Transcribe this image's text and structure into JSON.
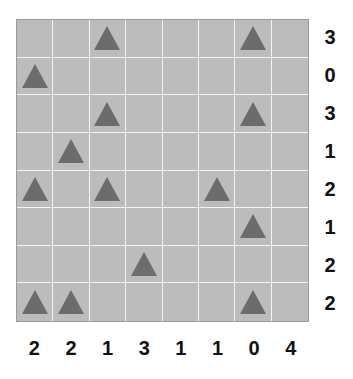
{
  "puzzle": {
    "rows": 8,
    "cols": 8,
    "colors": {
      "cell_background": "#bcbcbc",
      "grid_line": "#f4f4f4",
      "border": "#9a9a9a",
      "tree": "#6c6c6c",
      "clue_text": "#111111"
    },
    "icon": "triangle-tree-icon",
    "grid": [
      [
        0,
        0,
        1,
        0,
        0,
        0,
        1,
        0
      ],
      [
        1,
        0,
        0,
        0,
        0,
        0,
        0,
        0
      ],
      [
        0,
        0,
        1,
        0,
        0,
        0,
        1,
        0
      ],
      [
        0,
        1,
        0,
        0,
        0,
        0,
        0,
        0
      ],
      [
        1,
        0,
        1,
        0,
        0,
        1,
        0,
        0
      ],
      [
        0,
        0,
        0,
        0,
        0,
        0,
        1,
        0
      ],
      [
        0,
        0,
        0,
        1,
        0,
        0,
        0,
        0
      ],
      [
        1,
        1,
        0,
        0,
        0,
        0,
        1,
        0
      ]
    ],
    "row_clues": [
      "3",
      "0",
      "3",
      "1",
      "2",
      "1",
      "2",
      "2"
    ],
    "col_clues": [
      "2",
      "2",
      "1",
      "3",
      "1",
      "1",
      "0",
      "4"
    ]
  }
}
